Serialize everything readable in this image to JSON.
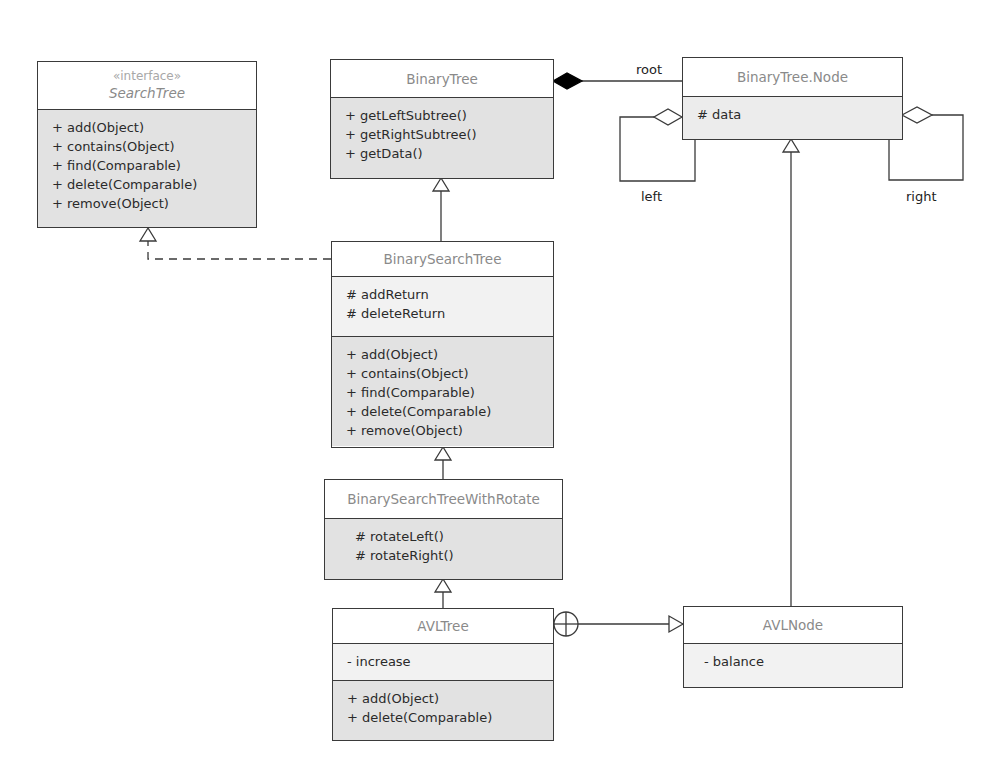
{
  "diagram": {
    "type": "UML class diagram",
    "classes": {
      "search_tree": {
        "stereotype": "«interface»",
        "name": "SearchTree",
        "operations": [
          "+ add(Object)",
          "+ contains(Object)",
          "+ find(Comparable)",
          "+ delete(Comparable)",
          "+ remove(Object)"
        ]
      },
      "binary_tree": {
        "name": "BinaryTree",
        "operations": [
          "+ getLeftSubtree()",
          "+ getRightSubtree()",
          "+ getData()"
        ]
      },
      "binary_tree_node": {
        "name": "BinaryTree.Node",
        "attributes": [
          "# data"
        ]
      },
      "binary_search_tree": {
        "name": "BinarySearchTree",
        "attributes": [
          "# addReturn",
          "# deleteReturn"
        ],
        "operations": [
          "+ add(Object)",
          "+ contains(Object)",
          "+ find(Comparable)",
          "+ delete(Comparable)",
          "+ remove(Object)"
        ]
      },
      "bst_with_rotate": {
        "name": "BinarySearchTreeWithRotate",
        "operations": [
          "# rotateLeft()",
          "# rotateRight()"
        ]
      },
      "avl_tree": {
        "name": "AVLTree",
        "attributes": [
          "- increase"
        ],
        "operations": [
          "+ add(Object)",
          "+ delete(Comparable)"
        ]
      },
      "avl_node": {
        "name": "AVLNode",
        "attributes": [
          "- balance"
        ]
      }
    },
    "relationships": [
      {
        "from": "BinarySearchTree",
        "to": "SearchTree",
        "kind": "realization"
      },
      {
        "from": "BinarySearchTree",
        "to": "BinaryTree",
        "kind": "generalization"
      },
      {
        "from": "BinaryTree",
        "to": "BinaryTree.Node",
        "kind": "composition",
        "role": "root"
      },
      {
        "from": "BinaryTree.Node",
        "to": "BinaryTree.Node",
        "kind": "aggregation",
        "role": "left"
      },
      {
        "from": "BinaryTree.Node",
        "to": "BinaryTree.Node",
        "kind": "aggregation",
        "role": "right"
      },
      {
        "from": "BinarySearchTreeWithRotate",
        "to": "BinarySearchTree",
        "kind": "generalization"
      },
      {
        "from": "AVLTree",
        "to": "BinarySearchTreeWithRotate",
        "kind": "generalization"
      },
      {
        "from": "AVLTree",
        "to": "AVLNode",
        "kind": "nesting"
      },
      {
        "from": "AVLNode",
        "to": "BinaryTree.Node",
        "kind": "generalization"
      }
    ],
    "role_labels": {
      "root": "root",
      "left": "left",
      "right": "right"
    },
    "colors": {
      "line": "#3a3a3a",
      "class_name": "#8a8a8a",
      "attribute_fill": "#f2f2f2",
      "operation_fill": "#e2e2e2"
    }
  }
}
